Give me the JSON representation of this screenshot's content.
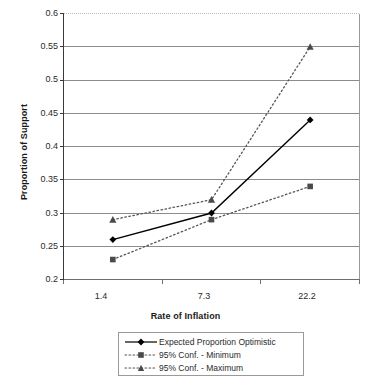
{
  "chart_data": {
    "type": "line",
    "title": "",
    "xlabel": "Rate of Inflation",
    "ylabel": "Proportion of Support",
    "categories": [
      "1.4",
      "7.3",
      "22.2"
    ],
    "x": [
      1.4,
      7.3,
      22.2
    ],
    "ylim": [
      0.2,
      0.6
    ],
    "yticks": [
      "0.2",
      "0.25",
      "0.3",
      "0.35",
      "0.4",
      "0.45",
      "0.5",
      "0.55",
      "0.6"
    ],
    "ytick_values": [
      0.2,
      0.25,
      0.3,
      0.35,
      0.4,
      0.45,
      0.5,
      0.55,
      0.6
    ],
    "grid": true,
    "legend_position": "bottom",
    "series": [
      {
        "name": "Expected Proportion Optimistic",
        "values": [
          0.26,
          0.3,
          0.44
        ],
        "style": "solid",
        "marker": "diamond",
        "color": "#000000"
      },
      {
        "name": "95% Conf. - Minimum",
        "values": [
          0.23,
          0.29,
          0.34
        ],
        "style": "dotted",
        "marker": "square",
        "color": "#555555"
      },
      {
        "name": "95% Conf. - Maximum",
        "values": [
          0.29,
          0.32,
          0.55
        ],
        "style": "dotted",
        "marker": "triangle",
        "color": "#555555"
      }
    ]
  },
  "axes": {
    "y_title": "Proportion of Support",
    "x_title": "Rate of Inflation",
    "y_ticks": [
      "0.6",
      "0.55",
      "0.5",
      "0.45",
      "0.4",
      "0.35",
      "0.3",
      "0.25",
      "0.2"
    ],
    "x_ticks": [
      "1.4",
      "7.3",
      "22.2"
    ]
  },
  "legend": {
    "items": [
      {
        "label": "Expected Proportion Optimistic"
      },
      {
        "label": "95% Conf. - Minimum"
      },
      {
        "label": "95% Conf. - Maximum"
      }
    ]
  },
  "colors": {
    "plot_border": "#7a7a7a",
    "gridline": "#8c8c8c",
    "series_primary": "#000000",
    "series_confidence": "#555555",
    "background": "#ffffff"
  }
}
